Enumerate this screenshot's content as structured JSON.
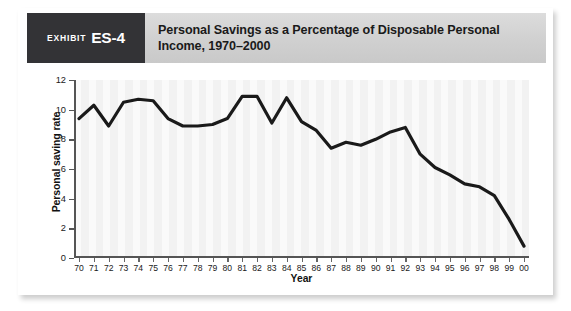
{
  "exhibit": {
    "word": "Exhibit",
    "number": "ES-4"
  },
  "header": {
    "title": "Personal Savings as a Percentage of Disposable Personal Income, 1970–2000"
  },
  "colors": {
    "exhibit_box": "#333336",
    "header_bar": "#d2d2d2",
    "line": "#1a1a1a",
    "axis": "#555555",
    "plot_stripe_light": "#fafafa",
    "plot_stripe_dark": "#f2f2f2"
  },
  "chart_data": {
    "type": "line",
    "title": "Personal Savings as a Percentage of Disposable Personal Income, 1970–2000",
    "xlabel": "Year",
    "ylabel": "Personal saving rate",
    "xlim": [
      0,
      30
    ],
    "ylim": [
      0,
      12
    ],
    "yticks": [
      0,
      2,
      4,
      6,
      8,
      10,
      12
    ],
    "ytick_labels": [
      "0",
      "2",
      "4",
      "6",
      "8",
      "10",
      "12"
    ],
    "grid": false,
    "legend": null,
    "categories": [
      "70",
      "71",
      "72",
      "73",
      "74",
      "75",
      "76",
      "77",
      "78",
      "79",
      "80",
      "81",
      "82",
      "83",
      "84",
      "85",
      "86",
      "87",
      "88",
      "89",
      "90",
      "91",
      "92",
      "93",
      "94",
      "95",
      "96",
      "97",
      "98",
      "99",
      "00"
    ],
    "values": [
      9.4,
      10.3,
      8.9,
      10.5,
      10.7,
      10.6,
      9.4,
      8.9,
      8.9,
      9.0,
      9.4,
      10.9,
      10.9,
      9.1,
      10.8,
      9.2,
      8.6,
      7.4,
      7.8,
      7.6,
      8.0,
      8.5,
      8.8,
      7.0,
      6.1,
      5.6,
      5.0,
      4.8,
      4.2,
      2.6,
      0.8
    ]
  }
}
